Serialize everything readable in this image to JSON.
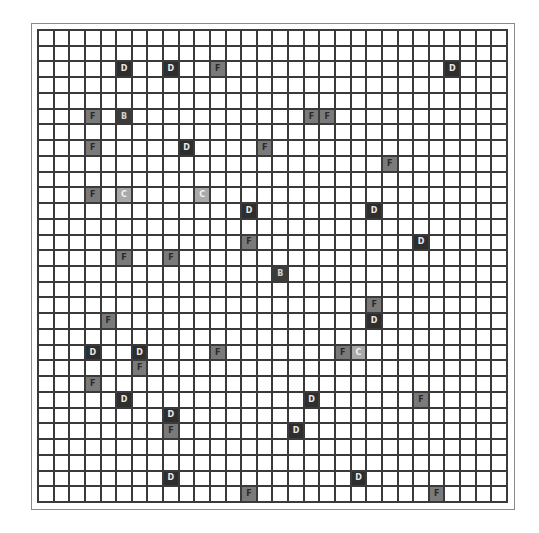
{
  "board": {
    "rows": 30,
    "cols": 30,
    "colors": {
      "D": "#2e2e2e",
      "F": "#7a7a7a",
      "C": "#a9a9a9",
      "B": "#3c3c3c",
      "empty": "#ffffff",
      "gridline": "#3a3a3a"
    },
    "cells": [
      {
        "row": 2,
        "col": 5,
        "label": "D"
      },
      {
        "row": 2,
        "col": 8,
        "label": "D"
      },
      {
        "row": 2,
        "col": 11,
        "label": "F"
      },
      {
        "row": 2,
        "col": 26,
        "label": "D"
      },
      {
        "row": 5,
        "col": 3,
        "label": "F"
      },
      {
        "row": 5,
        "col": 5,
        "label": "B"
      },
      {
        "row": 5,
        "col": 17,
        "label": "F"
      },
      {
        "row": 5,
        "col": 18,
        "label": "F"
      },
      {
        "row": 7,
        "col": 3,
        "label": "F"
      },
      {
        "row": 7,
        "col": 9,
        "label": "D"
      },
      {
        "row": 7,
        "col": 14,
        "label": "F"
      },
      {
        "row": 8,
        "col": 22,
        "label": "F"
      },
      {
        "row": 10,
        "col": 3,
        "label": "F"
      },
      {
        "row": 10,
        "col": 5,
        "label": "C"
      },
      {
        "row": 10,
        "col": 10,
        "label": "C"
      },
      {
        "row": 11,
        "col": 13,
        "label": "D"
      },
      {
        "row": 11,
        "col": 21,
        "label": "D"
      },
      {
        "row": 13,
        "col": 13,
        "label": "F"
      },
      {
        "row": 13,
        "col": 24,
        "label": "D"
      },
      {
        "row": 14,
        "col": 5,
        "label": "F"
      },
      {
        "row": 14,
        "col": 8,
        "label": "F"
      },
      {
        "row": 15,
        "col": 15,
        "label": "B"
      },
      {
        "row": 17,
        "col": 21,
        "label": "F"
      },
      {
        "row": 18,
        "col": 4,
        "label": "F"
      },
      {
        "row": 18,
        "col": 21,
        "label": "D"
      },
      {
        "row": 20,
        "col": 3,
        "label": "D"
      },
      {
        "row": 20,
        "col": 6,
        "label": "D"
      },
      {
        "row": 20,
        "col": 11,
        "label": "F"
      },
      {
        "row": 20,
        "col": 19,
        "label": "F"
      },
      {
        "row": 20,
        "col": 20,
        "label": "C"
      },
      {
        "row": 21,
        "col": 6,
        "label": "F"
      },
      {
        "row": 22,
        "col": 3,
        "label": "F"
      },
      {
        "row": 23,
        "col": 5,
        "label": "D"
      },
      {
        "row": 23,
        "col": 17,
        "label": "D"
      },
      {
        "row": 23,
        "col": 24,
        "label": "F"
      },
      {
        "row": 24,
        "col": 8,
        "label": "D"
      },
      {
        "row": 25,
        "col": 8,
        "label": "F"
      },
      {
        "row": 25,
        "col": 16,
        "label": "D"
      },
      {
        "row": 28,
        "col": 8,
        "label": "D"
      },
      {
        "row": 28,
        "col": 20,
        "label": "D"
      },
      {
        "row": 29,
        "col": 13,
        "label": "F"
      },
      {
        "row": 29,
        "col": 25,
        "label": "F"
      }
    ]
  }
}
